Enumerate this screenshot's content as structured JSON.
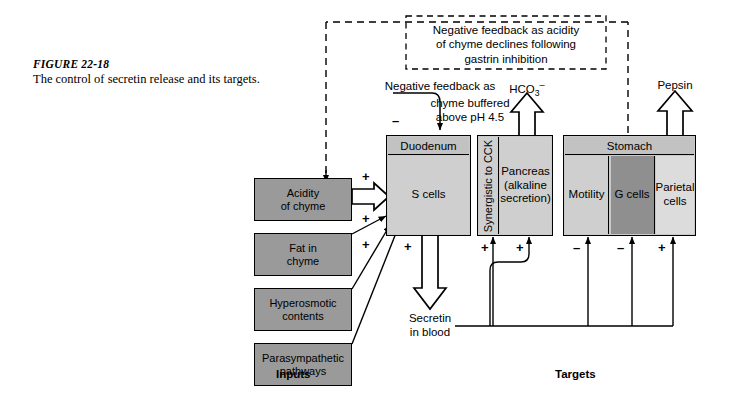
{
  "caption": {
    "figure_number": "FIGURE 22-18",
    "text": "The control of secretin release and its targets."
  },
  "feedback": {
    "top_box": "Negative feedback as acidity\nof chyme declines following\ngastrin inhibition",
    "duodenum_feedback": "Negative feedback as",
    "duodenum_feedback_line2": "chyme buffered\nabove pH 4.5",
    "minus_sign": "–"
  },
  "outputs": {
    "bicarbonate": "HCO",
    "bicarbonate_sub": "3",
    "bicarbonate_sup": "–",
    "pepsin": "Pepsin",
    "secretin": "Secretin\nin blood"
  },
  "inputs": {
    "section_label": "Inputs",
    "items": [
      {
        "label": "Acidity\nof chyme",
        "sign": "+"
      },
      {
        "label": "Fat in\nchyme",
        "sign": "+"
      },
      {
        "label": "Hyperosmotic\ncontents",
        "sign": "+"
      },
      {
        "label": "Parasympathetic\npathways",
        "sign": "+"
      }
    ]
  },
  "targets": {
    "section_label": "Targets",
    "duodenum": {
      "header": "Duodenum",
      "cells": "S cells"
    },
    "pancreas": {
      "side_label": "Synergistic to CCK",
      "body": "Pancreas\n(alkaline\nsecretion)",
      "signs": [
        "+",
        "+"
      ]
    },
    "stomach": {
      "header": "Stomach",
      "panes": [
        {
          "label": "Motility",
          "sign": "–"
        },
        {
          "label": "G cells",
          "sign": "–"
        },
        {
          "label": "Parietal\ncells",
          "sign": "+"
        }
      ]
    }
  },
  "colors": {
    "input_box_fill": "#9a9a9a",
    "organ_fill": "#c9c9c9",
    "header_fill": "#c2c2c2",
    "dark_pane_fill": "#8f8f8f",
    "light_pane_fill": "#dcdcdc",
    "stroke": "#000000",
    "background": "#ffffff"
  }
}
